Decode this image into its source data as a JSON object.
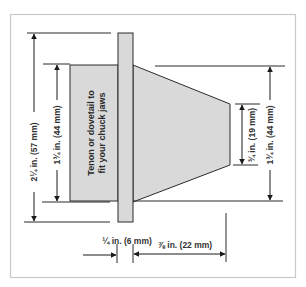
{
  "diagram": {
    "colors": {
      "frame": "#c8c8c8",
      "fill": "#d9d9d9",
      "outline": "#2b2b2b",
      "text": "#333333"
    },
    "labels": {
      "overall_height": "2¼ in. (57 mm)",
      "tenon_height": "1¾ in. (44 mm)",
      "taper_large_end": "1¾ in. (44 mm)",
      "taper_small_end": "¾ in. (19 mm)",
      "plate_thickness": "¼ in. (6 mm)",
      "taper_length": "⅞ in. (22 mm)",
      "tenon_note_line1": "Tenon or dovetail to",
      "tenon_note_line2": "fit your chuck jaws"
    }
  }
}
